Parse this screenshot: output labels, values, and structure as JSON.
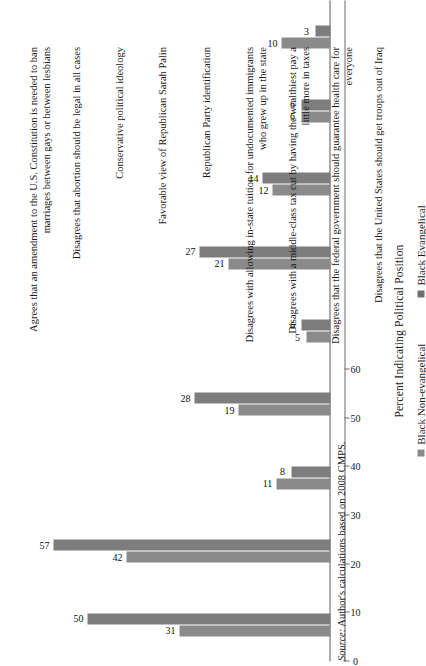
{
  "chart_data": {
    "type": "bar",
    "title": "",
    "xlabel": "Percent Indicating Political Position",
    "ylabel": "",
    "orientation": "vertical-rotated",
    "xlim": [
      0,
      60
    ],
    "ticks": [
      0,
      10,
      20,
      30,
      40,
      50,
      60
    ],
    "grid": false,
    "legend_position": "bottom-center",
    "categories": [
      "Agrees that an amendment to the U.S. Constitution is needed to ban marriages between gays or between lesbians",
      "Disagrees that abortion should be legal in all cases",
      "Conservative political ideology",
      "Favorable view of Republican Sarah Palin",
      "Republican Party identification",
      "Disagrees with allowing in-state tuition for undocumented immigrants who grew up in the state",
      "Disagrees with a middle-class tax cut by having the wealthiest pay a little more in taxes",
      "Disagrees that the federal government should guarantee health care for everyone",
      "Disagrees that the United States should get troops out of Iraq"
    ],
    "series": [
      {
        "name": "Black Non-evangelical",
        "color": "#8a8a8a",
        "values": [
          31,
          42,
          11,
          19,
          5,
          21,
          12,
          6,
          10
        ]
      },
      {
        "name": "Black Evangelical",
        "color": "#6f6f6f",
        "values": [
          50,
          57,
          8,
          28,
          6,
          27,
          14,
          6,
          3
        ]
      }
    ]
  },
  "legend": {
    "items": [
      {
        "label": "Black Non-evangelical"
      },
      {
        "label": "Black Evangelical"
      }
    ]
  },
  "source": {
    "prefix": "Source:",
    "text": " Author's calculations based on 2008 CMPS."
  }
}
